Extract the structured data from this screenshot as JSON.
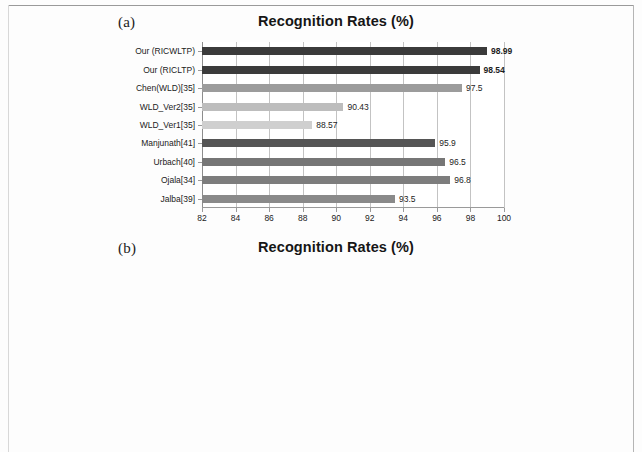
{
  "figure": {
    "background_color": "#fdfdfd",
    "panels": [
      {
        "letter": "(a)",
        "title": "Recognition Rates (%)"
      },
      {
        "letter": "(b)",
        "title": "Recognition Rates (%)"
      }
    ]
  },
  "chart_data": [
    {
      "type": "bar",
      "orientation": "horizontal",
      "panel": "(a)",
      "title": "Recognition Rates (%)",
      "xlabel": "",
      "ylabel": "",
      "xlim": [
        82,
        100
      ],
      "xticks": [
        82,
        84,
        86,
        88,
        90,
        92,
        94,
        96,
        98,
        100
      ],
      "xtick_labels": [
        "82",
        "84",
        "86",
        "88",
        "90",
        "92",
        "94",
        "96",
        "98",
        "100"
      ],
      "grid": true,
      "legend": "none",
      "categories": [
        "Our (RICWLTP)",
        "Our (RICLTP)",
        "Chen(WLD)[35]",
        "WLD_Ver2[35]",
        "WLD_Ver1[35]",
        "Manjunath[41]",
        "Urbach[40]",
        "Ojala[34]",
        "Jalba[39]"
      ],
      "values": [
        98.99,
        98.54,
        97.5,
        90.43,
        88.57,
        95.9,
        96.5,
        96.8,
        93.5
      ],
      "value_labels": [
        "98.99",
        "98.54",
        "97.5",
        "90.43",
        "88.57",
        "95.9",
        "96.5",
        "96.8",
        "93.5"
      ],
      "label_bold": [
        true,
        true,
        false,
        false,
        false,
        false,
        false,
        false,
        false
      ],
      "bar_colors": [
        "#3b3b3b",
        "#3b3b3b",
        "#9c9c9c",
        "#bdbdbd",
        "#cfcfcf",
        "#555555",
        "#767676",
        "#7d7d7d",
        "#8a8a8a"
      ]
    },
    {
      "type": "bar",
      "orientation": "horizontal",
      "panel": "(b)",
      "title": "Recognition Rates (%)",
      "xlabel": "",
      "ylabel": "",
      "xlim": [
        50,
        75
      ],
      "xticks": [
        50,
        55,
        60,
        65,
        70,
        75
      ],
      "xtick_labels": [
        "50",
        "55",
        "60",
        "65",
        "70",
        "75"
      ],
      "grid": true,
      "legend": "none",
      "categories": [
        "Our (RICWLTP)",
        "Our (RICLTP)",
        "Sharma(Clr-sampling)[36]",
        "Sharma(Rec-sampling) [36]",
        "Chen(MWLD)[35]",
        "Chen (WLD)[35]",
        "WLD_Ver2[35]",
        "WLD_Ver1[35]"
      ],
      "values": [
        73.24,
        71.98,
        73,
        71.7,
        64.7,
        56.4,
        60.05,
        56.55
      ],
      "value_labels": [
        "73.24",
        "71.98",
        "73",
        "71.7",
        "64.7",
        "56.4",
        "60.05",
        "56.55"
      ],
      "label_bold": [
        true,
        true,
        false,
        false,
        false,
        false,
        false,
        false
      ],
      "bar_colors": [
        "#3f3f3f",
        "#454545",
        "#939393",
        "#4a4a4a",
        "#8a8a8a",
        "#3f3f3f",
        "#a8a8a8",
        "#b0b0b0"
      ]
    }
  ]
}
